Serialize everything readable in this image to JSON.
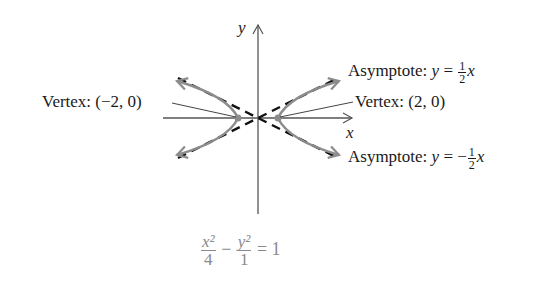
{
  "diagram": {
    "type": "hyperbola-graph",
    "axes": {
      "x_label": "x",
      "y_label": "y"
    },
    "labels": {
      "asymptote_pos": {
        "prefix": "Asymptote: ",
        "lhs": "y",
        "eq": " = ",
        "sign": "",
        "num": "1",
        "den": "2",
        "var": "x"
      },
      "asymptote_neg": {
        "prefix": "Asymptote: ",
        "lhs": "y",
        "eq": " = ",
        "sign": "−",
        "num": "1",
        "den": "2",
        "var": "x"
      },
      "vertex_left": "Vertex: (−2, 0)",
      "vertex_right": "Vertex: (2, 0)"
    },
    "equation": {
      "term1_num": "x²",
      "term1_den": "4",
      "op": " − ",
      "term2_num": "y²",
      "term2_den": "1",
      "rhs": " = 1"
    },
    "colors": {
      "axis": "#555555",
      "curve": "#8c8c8c",
      "asymptote": "#111111",
      "equation": "#8a8a8a",
      "vertex_dot": "#8c8c8c"
    }
  }
}
